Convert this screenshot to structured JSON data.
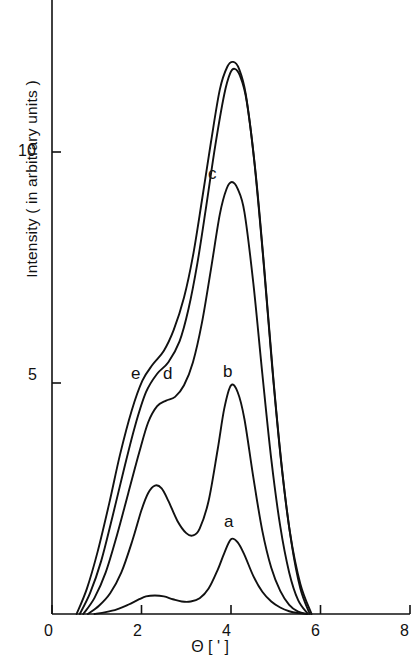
{
  "figure": {
    "background": "#ffffff",
    "line_color": "#111111",
    "axis_color": "#111111"
  },
  "chart_data": {
    "type": "line",
    "title": "",
    "subtitle": "",
    "xlabel": "Θ [ ' ]",
    "xlabel_symbol": "Θ",
    "xlabel_unit": "[ ' ]",
    "ylabel": "Intensity  ( in arbitrary units )",
    "xlim": [
      0,
      8
    ],
    "ylim": [
      0,
      12.6
    ],
    "xticks": [
      0,
      2,
      4,
      6,
      8
    ],
    "xticklabels": [
      "0",
      "2",
      "4",
      "6",
      "8"
    ],
    "yticks": [
      5,
      10
    ],
    "yticklabels": [
      "5",
      "10"
    ],
    "grid": false,
    "legend": "inline-curve-labels",
    "annotations": [
      {
        "text": "a",
        "x": 4.0,
        "y": 2.05,
        "curve": "a"
      },
      {
        "text": "b",
        "x": 3.97,
        "y": 5.35,
        "curve": "b"
      },
      {
        "text": "c",
        "x": 3.55,
        "y": 9.75,
        "curve": "c"
      },
      {
        "text": "d",
        "x": 2.62,
        "y": 5.32,
        "curve": "d"
      },
      {
        "text": "e",
        "x": 1.93,
        "y": 5.32,
        "curve": "e"
      }
    ],
    "series": [
      {
        "name": "a",
        "label": "a",
        "peak_main": {
          "x": 4.0,
          "y": 1.62
        },
        "peak_secondary": {
          "x": 2.3,
          "y": 0.4
        },
        "x": [
          0.95,
          1.2,
          1.45,
          1.7,
          1.95,
          2.1,
          2.3,
          2.5,
          2.7,
          2.9,
          3.1,
          3.3,
          3.5,
          3.7,
          3.85,
          4.0,
          4.15,
          4.3,
          4.5,
          4.7,
          4.9,
          5.1,
          5.3,
          5.5,
          5.7
        ],
        "y": [
          0.0,
          0.04,
          0.1,
          0.2,
          0.32,
          0.38,
          0.4,
          0.38,
          0.32,
          0.27,
          0.27,
          0.34,
          0.55,
          0.95,
          1.32,
          1.62,
          1.55,
          1.28,
          0.82,
          0.48,
          0.27,
          0.14,
          0.06,
          0.02,
          0.0
        ]
      },
      {
        "name": "b",
        "label": "b",
        "peak_main": {
          "x": 4.0,
          "y": 4.95
        },
        "peak_secondary": {
          "x": 2.3,
          "y": 2.78
        },
        "x": [
          0.8,
          1.05,
          1.3,
          1.55,
          1.8,
          2.0,
          2.15,
          2.3,
          2.45,
          2.6,
          2.8,
          3.0,
          3.15,
          3.3,
          3.5,
          3.7,
          3.85,
          4.0,
          4.15,
          4.3,
          4.5,
          4.7,
          4.9,
          5.1,
          5.3,
          5.5,
          5.7
        ],
        "y": [
          0.0,
          0.18,
          0.45,
          0.9,
          1.6,
          2.25,
          2.62,
          2.78,
          2.72,
          2.45,
          2.02,
          1.75,
          1.7,
          1.85,
          2.45,
          3.55,
          4.45,
          4.95,
          4.8,
          4.22,
          2.95,
          1.8,
          1.0,
          0.5,
          0.2,
          0.05,
          0.0
        ]
      },
      {
        "name": "c",
        "label": "c",
        "peak_main": {
          "x": 4.0,
          "y": 9.35
        },
        "shoulder": {
          "x": 2.5,
          "y": 4.6
        },
        "x": [
          0.7,
          0.95,
          1.2,
          1.45,
          1.7,
          1.95,
          2.15,
          2.35,
          2.55,
          2.75,
          2.95,
          3.15,
          3.35,
          3.55,
          3.75,
          3.9,
          4.02,
          4.15,
          4.3,
          4.5,
          4.7,
          4.9,
          5.1,
          5.3,
          5.5,
          5.72
        ],
        "y": [
          0.0,
          0.35,
          0.9,
          1.7,
          2.6,
          3.5,
          4.15,
          4.5,
          4.62,
          4.7,
          4.95,
          5.45,
          6.3,
          7.45,
          8.65,
          9.2,
          9.35,
          9.2,
          8.7,
          7.15,
          5.2,
          3.35,
          1.9,
          0.9,
          0.3,
          0.0
        ]
      },
      {
        "name": "d",
        "label": "d",
        "peak_main": {
          "x": 4.05,
          "y": 11.8
        },
        "shoulder": {
          "x": 2.6,
          "y": 5.35
        },
        "x": [
          0.62,
          0.85,
          1.1,
          1.35,
          1.6,
          1.85,
          2.1,
          2.35,
          2.6,
          2.85,
          3.05,
          3.25,
          3.45,
          3.65,
          3.85,
          3.98,
          4.08,
          4.2,
          4.35,
          4.55,
          4.75,
          4.95,
          5.15,
          5.35,
          5.55,
          5.76
        ],
        "y": [
          0.0,
          0.45,
          1.15,
          2.1,
          3.1,
          4.05,
          4.8,
          5.2,
          5.45,
          5.9,
          6.6,
          7.6,
          8.85,
          10.15,
          11.25,
          11.7,
          11.8,
          11.65,
          11.1,
          9.55,
          7.4,
          5.05,
          3.05,
          1.55,
          0.55,
          0.0
        ]
      },
      {
        "name": "e",
        "label": "e",
        "peak_main": {
          "x": 4.05,
          "y": 11.95
        },
        "shoulder": {
          "x": 2.2,
          "y": 5.35
        },
        "x": [
          0.55,
          0.78,
          1.02,
          1.28,
          1.52,
          1.78,
          2.02,
          2.25,
          2.5,
          2.72,
          2.95,
          3.15,
          3.35,
          3.55,
          3.75,
          3.92,
          4.05,
          4.18,
          4.33,
          4.52,
          4.72,
          4.92,
          5.12,
          5.32,
          5.55,
          5.8
        ],
        "y": [
          0.0,
          0.55,
          1.35,
          2.4,
          3.45,
          4.4,
          5.05,
          5.4,
          5.7,
          6.15,
          6.85,
          7.75,
          8.95,
          10.2,
          11.35,
          11.85,
          11.95,
          11.8,
          11.25,
          9.8,
          7.7,
          5.35,
          3.3,
          1.75,
          0.65,
          0.0
        ]
      }
    ]
  },
  "axes": {
    "x_tick_label_0": "0",
    "x_tick_label_2": "2",
    "x_tick_label_4": "4",
    "x_tick_label_6": "6",
    "x_tick_label_8": "8",
    "y_tick_label_5": "5",
    "y_tick_label_10": "10"
  },
  "labels": {
    "curve_a": "a",
    "curve_b": "b",
    "curve_c": "c",
    "curve_d": "d",
    "curve_e": "e",
    "y_axis_title": "Intensity  ( in arbitrary units )",
    "x_axis_title": "Θ [ ' ]"
  }
}
